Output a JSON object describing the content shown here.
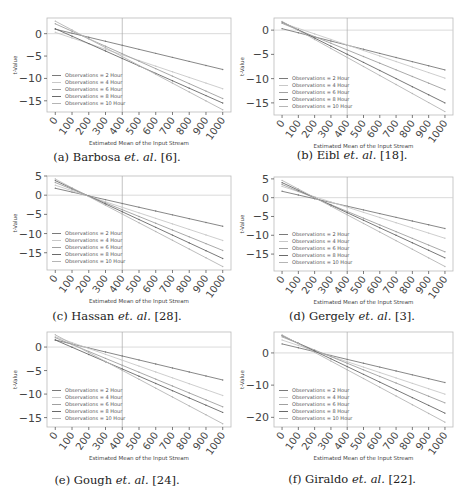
{
  "figure": {
    "panels": [
      {
        "id": "a",
        "caption_prefix": "(a) Barbosa ",
        "caption_italic": "et. al.",
        "caption_suffix": " [6].",
        "ylabel": "t-Value",
        "xlabel": "Estimated Mean of the Input Stream"
      },
      {
        "id": "b",
        "caption_prefix": "(b) Eibl ",
        "caption_italic": "et. al.",
        "caption_suffix": " [18].",
        "ylabel": "t-Value",
        "xlabel": "Estimated Mean of the Input Stream"
      },
      {
        "id": "c",
        "caption_prefix": "(c) Hassan ",
        "caption_italic": "et. al.",
        "caption_suffix": " [28].",
        "ylabel": "t-Value",
        "xlabel": "Estimated Mean of the Input Stream"
      },
      {
        "id": "d",
        "caption_prefix": "(d) Gergely ",
        "caption_italic": "et. al.",
        "caption_suffix": " [3].",
        "ylabel": "t-Value",
        "xlabel": "Estimated Mean of the Input Stream"
      },
      {
        "id": "e",
        "caption_prefix": "(e) Gough ",
        "caption_italic": "et. al.",
        "caption_suffix": " [24].",
        "ylabel": "t-Value",
        "xlabel": "Estimated Mean of the Input Stream"
      },
      {
        "id": "f",
        "caption_prefix": "(f) Giraldo ",
        "caption_italic": "et. al.",
        "caption_suffix": " [22].",
        "ylabel": "t-Value",
        "xlabel": "Estimated Mean of the Input Stream"
      }
    ]
  },
  "chart_data": [
    {
      "type": "line",
      "title": "(a) Barbosa et. al. [6]",
      "xlabel": "Estimated Mean of the Input Stream",
      "ylabel": "t-Value",
      "x": [
        0,
        100,
        200,
        300,
        400,
        500,
        600,
        700,
        800,
        900,
        1000
      ],
      "xticks": [
        0,
        100,
        200,
        300,
        400,
        500,
        600,
        700,
        800,
        900,
        1000
      ],
      "yticks": [
        0,
        -5,
        -10,
        -15
      ],
      "ylim": [
        -17.5,
        3.5
      ],
      "grid": false,
      "reference_lines": {
        "x": 400,
        "y": 0
      },
      "legend_position": "lower left",
      "series": [
        {
          "name": "Observations = 2 Hour",
          "start": 1.0,
          "end": -8.0
        },
        {
          "name": "Observations = 4 Hour",
          "start": 0.3,
          "end": -12.3
        },
        {
          "name": "Observations = 6 Hour",
          "start": 2.2,
          "end": -14.5
        },
        {
          "name": "Observations = 8 Hour",
          "start": 1.1,
          "end": -15.5
        },
        {
          "name": "Observations = 10 Hour",
          "start": 2.8,
          "end": -17.0
        }
      ]
    },
    {
      "type": "line",
      "title": "(b) Eibl et. al. [18]",
      "xlabel": "Estimated Mean of the Input Stream",
      "ylabel": "t-Value",
      "x": [
        0,
        100,
        200,
        300,
        400,
        500,
        600,
        700,
        800,
        900,
        1000
      ],
      "xticks": [
        0,
        100,
        200,
        300,
        400,
        500,
        600,
        700,
        800,
        900,
        1000
      ],
      "yticks": [
        0,
        -5,
        -10,
        -15
      ],
      "ylim": [
        -17.5,
        2.5
      ],
      "grid": false,
      "reference_lines": {
        "x": 400,
        "y": 0
      },
      "legend_position": "lower left",
      "series": [
        {
          "name": "Observations = 2 Hour",
          "start": 0.3,
          "end": -8.2
        },
        {
          "name": "Observations = 4 Hour",
          "start": 1.5,
          "end": -9.9
        },
        {
          "name": "Observations = 6 Hour",
          "start": 1.4,
          "end": -12.3
        },
        {
          "name": "Observations = 8 Hour",
          "start": 1.7,
          "end": -15.0
        },
        {
          "name": "Observations = 10 Hour",
          "start": 1.8,
          "end": -16.8
        }
      ]
    },
    {
      "type": "line",
      "title": "(c) Hassan et. al. [28]",
      "xlabel": "Estimated Mean of the Input Stream",
      "ylabel": "t-Value",
      "x": [
        0,
        100,
        200,
        300,
        400,
        500,
        600,
        700,
        800,
        900,
        1000
      ],
      "xticks": [
        0,
        100,
        200,
        300,
        400,
        500,
        600,
        700,
        800,
        900,
        1000
      ],
      "yticks": [
        5,
        0,
        -5,
        -10,
        -15
      ],
      "ylim": [
        -19.5,
        5.0
      ],
      "grid": false,
      "reference_lines": {
        "x": 400,
        "y": 0
      },
      "legend_position": "lower left",
      "series": [
        {
          "name": "Observations = 2 Hour",
          "start": 1.8,
          "end": -8.1
        },
        {
          "name": "Observations = 4 Hour",
          "start": 2.6,
          "end": -11.8
        },
        {
          "name": "Observations = 6 Hour",
          "start": 3.3,
          "end": -14.4
        },
        {
          "name": "Observations = 8 Hour",
          "start": 3.8,
          "end": -16.5
        },
        {
          "name": "Observations = 10 Hour",
          "start": 4.2,
          "end": -18.6
        }
      ]
    },
    {
      "type": "line",
      "title": "(d) Gergely et. al. [3]",
      "xlabel": "Estimated Mean of the Input Stream",
      "ylabel": "t-Value",
      "x": [
        0,
        100,
        200,
        300,
        400,
        500,
        600,
        700,
        800,
        900,
        1000
      ],
      "xticks": [
        0,
        100,
        200,
        300,
        400,
        500,
        600,
        700,
        800,
        900,
        1000
      ],
      "yticks": [
        5,
        0,
        -5,
        -10,
        -15
      ],
      "ylim": [
        -19.5,
        5.5
      ],
      "grid": false,
      "reference_lines": {
        "x": 400,
        "y": 0
      },
      "legend_position": "lower left",
      "series": [
        {
          "name": "Observations = 2 Hour",
          "start": 1.7,
          "end": -8.2
        },
        {
          "name": "Observations = 4 Hour",
          "start": 3.0,
          "end": -10.8
        },
        {
          "name": "Observations = 6 Hour",
          "start": 3.5,
          "end": -14.4
        },
        {
          "name": "Observations = 8 Hour",
          "start": 4.0,
          "end": -16.0
        },
        {
          "name": "Observations = 10 Hour",
          "start": 4.6,
          "end": -18.3
        }
      ]
    },
    {
      "type": "line",
      "title": "(e) Gough et. al. [24]",
      "xlabel": "Estimated Mean of the Input Stream",
      "ylabel": "t-Value",
      "x": [
        0,
        100,
        200,
        300,
        400,
        500,
        600,
        700,
        800,
        900,
        1000
      ],
      "xticks": [
        0,
        100,
        200,
        300,
        400,
        500,
        600,
        700,
        800,
        900,
        1000
      ],
      "yticks": [
        0,
        -5,
        -10,
        -15
      ],
      "ylim": [
        -17.0,
        3.2
      ],
      "grid": false,
      "reference_lines": {
        "x": 400,
        "y": 0
      },
      "legend_position": "lower left",
      "series": [
        {
          "name": "Observations = 2 Hour",
          "start": 1.5,
          "end": -7.0
        },
        {
          "name": "Observations = 4 Hour",
          "start": 2.2,
          "end": -10.3
        },
        {
          "name": "Observations = 6 Hour",
          "start": 2.0,
          "end": -12.7
        },
        {
          "name": "Observations = 8 Hour",
          "start": 1.5,
          "end": -13.9
        },
        {
          "name": "Observations = 10 Hour",
          "start": 2.6,
          "end": -16.3
        }
      ]
    },
    {
      "type": "line",
      "title": "(f) Giraldo et. al. [22]",
      "xlabel": "Estimated Mean of the Input Stream",
      "ylabel": "t-Value",
      "x": [
        0,
        100,
        200,
        300,
        400,
        500,
        600,
        700,
        800,
        900,
        1000
      ],
      "xticks": [
        0,
        100,
        200,
        300,
        400,
        500,
        600,
        700,
        800,
        900,
        1000
      ],
      "yticks": [
        0,
        -10,
        -20
      ],
      "ylim": [
        -23.0,
        6.5
      ],
      "grid": false,
      "reference_lines": {
        "x": 400,
        "y": 0
      },
      "legend_position": "lower left",
      "series": [
        {
          "name": "Observations = 2 Hour",
          "start": 2.8,
          "end": -9.2
        },
        {
          "name": "Observations = 4 Hour",
          "start": 4.0,
          "end": -12.8
        },
        {
          "name": "Observations = 6 Hour",
          "start": 5.0,
          "end": -15.5
        },
        {
          "name": "Observations = 8 Hour",
          "start": 5.4,
          "end": -18.7
        },
        {
          "name": "Observations = 10 Hour",
          "start": 5.6,
          "end": -21.5
        }
      ]
    }
  ],
  "style": {
    "series_colors": [
      "#7a7a7a",
      "#c8c8c8",
      "#a0a0a0",
      "#6a6a6a",
      "#b5b5b5"
    ],
    "axis_color": "#444444",
    "ref_line_color": "#d0d0d0",
    "text_color": "#444444"
  }
}
